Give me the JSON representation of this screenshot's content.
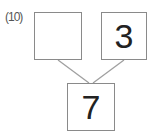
{
  "problem": {
    "label": "(10)",
    "left_box": {
      "value": ""
    },
    "right_box": {
      "value": "3"
    },
    "bottom_box": {
      "value": "7"
    }
  },
  "colors": {
    "border": "#8a8a8a",
    "line": "#9a9a9a",
    "text": "#222222"
  }
}
